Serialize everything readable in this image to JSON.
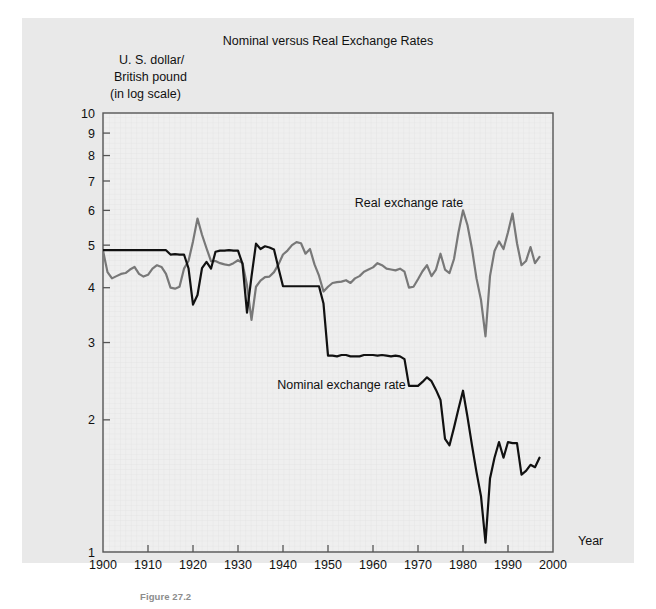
{
  "figure": {
    "caption": "Figure 27.2",
    "background_color": "#e9e9e9",
    "plot_background_color": "#efefef"
  },
  "chart_data": {
    "type": "line",
    "title": "Nominal versus Real Exchange Rates",
    "xlabel": "Year",
    "ylabel": "U. S. dollar/\nBritish pound\n(in log scale)",
    "ylabel_lines": [
      "U. S. dollar/",
      "British pound",
      "(in log scale)"
    ],
    "yscale": "log",
    "xlim": [
      1900,
      2000
    ],
    "ylim": [
      1,
      10
    ],
    "xticks": [
      1900,
      1910,
      1920,
      1930,
      1940,
      1950,
      1960,
      1970,
      1980,
      1990,
      2000
    ],
    "xtick_labels": [
      "1900",
      "1910",
      "1920",
      "1930",
      "1940",
      "1950",
      "1960",
      "1970",
      "1980",
      "1990",
      "2000"
    ],
    "yticks": [
      1,
      2,
      3,
      4,
      5,
      6,
      7,
      8,
      9,
      10
    ],
    "ytick_labels": [
      "1",
      "2",
      "3",
      "4",
      "5",
      "6",
      "7",
      "8",
      "9",
      "10"
    ],
    "grid": true,
    "legend_position": "inline-annotations",
    "annotations": [
      {
        "text": "Real exchange rate",
        "x": 1968,
        "y": 6.1,
        "color": "#777777"
      },
      {
        "text": "Nominal exchange rate",
        "x": 1953,
        "y": 2.35,
        "color": "#111111"
      }
    ],
    "series": [
      {
        "name": "Nominal exchange rate",
        "color": "#111111",
        "linewidth": 2.2,
        "x": [
          1900,
          1901,
          1902,
          1903,
          1904,
          1905,
          1906,
          1907,
          1908,
          1909,
          1910,
          1911,
          1912,
          1913,
          1914,
          1915,
          1916,
          1917,
          1918,
          1919,
          1920,
          1921,
          1922,
          1923,
          1924,
          1925,
          1926,
          1927,
          1928,
          1929,
          1930,
          1931,
          1932,
          1933,
          1934,
          1935,
          1936,
          1937,
          1938,
          1939,
          1940,
          1941,
          1942,
          1943,
          1944,
          1945,
          1946,
          1947,
          1948,
          1949,
          1950,
          1951,
          1952,
          1953,
          1954,
          1955,
          1956,
          1957,
          1958,
          1959,
          1960,
          1961,
          1962,
          1963,
          1964,
          1965,
          1966,
          1967,
          1968,
          1969,
          1970,
          1971,
          1972,
          1973,
          1974,
          1975,
          1976,
          1977,
          1978,
          1979,
          1980,
          1981,
          1982,
          1983,
          1984,
          1985,
          1986,
          1987,
          1988,
          1989,
          1990,
          1991,
          1992,
          1993,
          1994,
          1995,
          1996,
          1997
        ],
        "values": [
          4.87,
          4.87,
          4.87,
          4.87,
          4.87,
          4.87,
          4.87,
          4.87,
          4.87,
          4.87,
          4.87,
          4.87,
          4.87,
          4.87,
          4.87,
          4.76,
          4.77,
          4.76,
          4.76,
          4.43,
          3.66,
          3.85,
          4.43,
          4.58,
          4.42,
          4.83,
          4.86,
          4.86,
          4.87,
          4.86,
          4.86,
          4.53,
          3.51,
          4.24,
          5.04,
          4.9,
          4.97,
          4.94,
          4.89,
          4.43,
          4.03,
          4.03,
          4.03,
          4.03,
          4.03,
          4.03,
          4.03,
          4.03,
          4.03,
          3.68,
          2.8,
          2.8,
          2.79,
          2.81,
          2.81,
          2.79,
          2.79,
          2.79,
          2.81,
          2.81,
          2.81,
          2.8,
          2.81,
          2.8,
          2.79,
          2.8,
          2.79,
          2.75,
          2.39,
          2.39,
          2.39,
          2.44,
          2.5,
          2.45,
          2.34,
          2.22,
          1.81,
          1.75,
          1.92,
          2.12,
          2.33,
          2.03,
          1.75,
          1.52,
          1.34,
          1.05,
          1.47,
          1.64,
          1.78,
          1.64,
          1.78,
          1.77,
          1.77,
          1.5,
          1.53,
          1.58,
          1.56,
          1.64
        ]
      },
      {
        "name": "Real exchange rate",
        "color": "#787878",
        "linewidth": 2.2,
        "x": [
          1900,
          1901,
          1902,
          1903,
          1904,
          1905,
          1906,
          1907,
          1908,
          1909,
          1910,
          1911,
          1912,
          1913,
          1914,
          1915,
          1916,
          1917,
          1918,
          1919,
          1920,
          1921,
          1922,
          1923,
          1924,
          1925,
          1926,
          1927,
          1928,
          1929,
          1930,
          1931,
          1932,
          1933,
          1934,
          1935,
          1936,
          1937,
          1938,
          1939,
          1940,
          1941,
          1942,
          1943,
          1944,
          1945,
          1946,
          1947,
          1948,
          1949,
          1950,
          1951,
          1952,
          1953,
          1954,
          1955,
          1956,
          1957,
          1958,
          1959,
          1960,
          1961,
          1962,
          1963,
          1964,
          1965,
          1966,
          1967,
          1968,
          1969,
          1970,
          1971,
          1972,
          1973,
          1974,
          1975,
          1976,
          1977,
          1978,
          1979,
          1980,
          1981,
          1982,
          1983,
          1984,
          1985,
          1986,
          1987,
          1988,
          1989,
          1990,
          1991,
          1992,
          1993,
          1994,
          1995,
          1996,
          1997
        ],
        "values": [
          4.86,
          4.34,
          4.2,
          4.25,
          4.3,
          4.32,
          4.4,
          4.46,
          4.3,
          4.24,
          4.28,
          4.42,
          4.5,
          4.46,
          4.3,
          4.0,
          3.98,
          4.02,
          4.42,
          4.6,
          5.1,
          5.75,
          5.28,
          4.92,
          4.6,
          4.6,
          4.55,
          4.52,
          4.5,
          4.55,
          4.62,
          4.55,
          4.05,
          3.38,
          4.02,
          4.15,
          4.23,
          4.24,
          4.34,
          4.52,
          4.76,
          4.86,
          5.0,
          5.08,
          5.05,
          4.78,
          4.9,
          4.52,
          4.26,
          3.92,
          4.02,
          4.1,
          4.12,
          4.13,
          4.16,
          4.1,
          4.2,
          4.25,
          4.35,
          4.4,
          4.45,
          4.55,
          4.5,
          4.42,
          4.4,
          4.38,
          4.42,
          4.35,
          4.0,
          4.02,
          4.18,
          4.36,
          4.5,
          4.25,
          4.4,
          4.78,
          4.4,
          4.32,
          4.65,
          5.35,
          6.0,
          5.55,
          4.9,
          4.2,
          3.75,
          3.1,
          4.25,
          4.85,
          5.1,
          4.9,
          5.35,
          5.9,
          5.05,
          4.5,
          4.6,
          4.95,
          4.55,
          4.7
        ]
      }
    ]
  }
}
